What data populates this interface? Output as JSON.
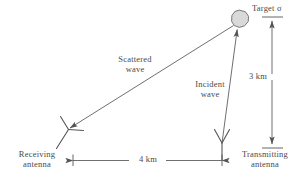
{
  "figure": {
    "title_alt": "Bistatic radar geometry diagram",
    "labels": {
      "target": "Target σ",
      "scattered_wave": "Scattered\nwave",
      "incident_wave": "Incident\nwave",
      "vertical_distance": "3 km",
      "horizontal_distance": "4 km",
      "receiving_antenna": "Receiving\nantenna",
      "transmitting_antenna": "Transmitting\nantenna"
    },
    "colors": {
      "line": "#555555",
      "text": "#4a4a4a",
      "target_fill": "#d9d9d9",
      "target_stroke": "#666666",
      "background": "#ffffff"
    },
    "geometry": {
      "target_center": [
        240,
        19
      ],
      "target_radius": 9,
      "transmitting_antenna_base": [
        222,
        160
      ],
      "receiving_antenna_base": [
        60,
        148
      ],
      "incident_wave_from": [
        222,
        143
      ],
      "incident_wave_to": [
        237,
        29
      ],
      "scattered_wave_from": [
        233,
        26
      ],
      "scattered_wave_to": [
        68,
        129
      ],
      "dim_vertical_x": 272,
      "dim_vertical_top": 17,
      "dim_vertical_bottom": 148,
      "dim_horizontal_y": 160,
      "dim_horizontal_left": 73,
      "dim_horizontal_right": 222
    },
    "values": {
      "range_target_to_transmitter_km": 3,
      "range_transmitter_to_receiver_km": 4
    }
  }
}
